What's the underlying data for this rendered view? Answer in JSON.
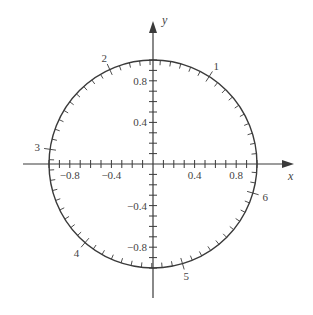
{
  "diagram": {
    "type": "unit-circle",
    "center_px": [
      153,
      164
    ],
    "radius_px": 104,
    "colors": {
      "stroke": "#3a3a3a",
      "text": "#444444",
      "background": "#ffffff"
    },
    "axes": {
      "x_label": "x",
      "y_label": "y",
      "x_ticks_step": 0.1,
      "y_ticks_step": 0.1,
      "x_tick_labels": [
        "−0.8",
        "−0.4",
        "0.4",
        "0.8"
      ],
      "x_tick_values": [
        -0.8,
        -0.4,
        0.4,
        0.8
      ],
      "y_tick_labels": [
        "0.8",
        "0.4",
        "−0.4",
        "−0.8"
      ],
      "y_tick_values": [
        0.8,
        0.4,
        -0.4,
        -0.8
      ]
    },
    "arc": {
      "tick_step_radians": 0.1,
      "labels": [
        "1",
        "2",
        "3",
        "4",
        "5",
        "6"
      ],
      "label_values": [
        1,
        2,
        3,
        4,
        5,
        6
      ]
    }
  }
}
